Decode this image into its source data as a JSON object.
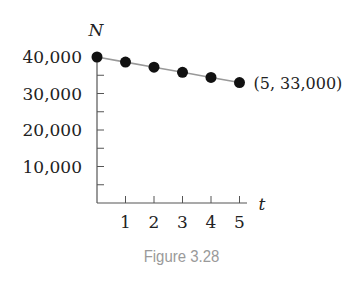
{
  "chart_data": {
    "type": "scatter",
    "title": "",
    "xlabel": "t",
    "ylabel": "N",
    "x": [
      0,
      1,
      2,
      3,
      4,
      5
    ],
    "series": [
      {
        "name": "N",
        "values": [
          40000,
          38600,
          37200,
          35800,
          34400,
          33000
        ],
        "line": true
      }
    ],
    "xlim": [
      0,
      5.3
    ],
    "ylim": [
      0,
      40000
    ],
    "x_ticks": [
      "1",
      "2",
      "3",
      "4",
      "5"
    ],
    "y_ticks": [
      "10,000",
      "20,000",
      "30,000",
      "40,000"
    ],
    "y_minor_tick_step": 5000,
    "grid": false,
    "annotations": [
      {
        "x": 5,
        "y": 33000,
        "text": "(5, 33,000)"
      }
    ]
  },
  "caption": "Figure 3.28"
}
